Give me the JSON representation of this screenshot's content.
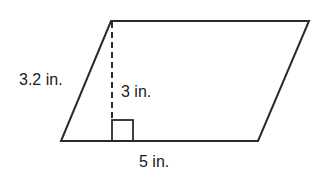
{
  "figure": {
    "shape": "parallelogram",
    "labels": {
      "side": "3.2 in.",
      "height": "3 in.",
      "base": "5 in."
    },
    "stroke_color": "#2a2a2a",
    "background": "#ffffff"
  }
}
